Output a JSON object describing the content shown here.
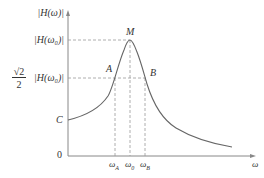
{
  "figure": {
    "y_axis_label": "|H(ω)|",
    "x_axis_label": "ω",
    "origin_label": "0",
    "y_ticks": {
      "peak": "|H(ω₀)|",
      "half_power_coef_num": "√2",
      "half_power_coef_den": "2",
      "half_power": "|H(ω₀)|"
    },
    "x_ticks": [
      "ω_A",
      "ω₀",
      "ω_B"
    ],
    "x_tick_main": [
      "ω",
      "ω",
      "ω"
    ],
    "x_tick_sub": [
      "A",
      "0",
      "B"
    ],
    "points": {
      "peak": "M",
      "left_half_power": "A",
      "right_half_power": "B",
      "intercept": "C"
    }
  },
  "colors": {
    "axis": "#888888",
    "curve": "#666666",
    "dashed": "#999999",
    "text": "#333333"
  }
}
